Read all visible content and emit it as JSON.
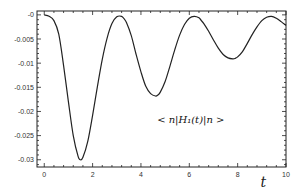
{
  "chart_data": {
    "type": "line",
    "title": "",
    "xlabel": "t",
    "ylabel": "",
    "annotation": "< n|H₁(t)|n >",
    "annotation_position": {
      "t": 5.0,
      "y": -0.0215
    },
    "xlim": [
      -0.3,
      10
    ],
    "ylim": [
      -0.0315,
      0.0008
    ],
    "x_ticks": [
      0,
      2,
      4,
      6,
      8,
      10
    ],
    "x_tick_labels": [
      "0",
      "2",
      "4",
      "6",
      "8",
      "10"
    ],
    "y_ticks": [
      0,
      -0.005,
      -0.01,
      -0.015,
      -0.02,
      -0.025,
      -0.03
    ],
    "y_tick_labels": [
      "-0",
      "-0.005",
      "-0.01",
      "-0.015",
      "-0.02",
      "-0.025",
      "-0.03"
    ],
    "grid": false,
    "legend": null,
    "series": [
      {
        "name": "<n|H1(t)|n>",
        "x": [
          0,
          0.2,
          0.4,
          0.6,
          0.8,
          1.0,
          1.2,
          1.4,
          1.5,
          1.6,
          1.8,
          2.0,
          2.2,
          2.4,
          2.6,
          2.8,
          3.0,
          3.2,
          3.3,
          3.4,
          3.6,
          3.8,
          4.0,
          4.2,
          4.4,
          4.6,
          4.7,
          4.8,
          5.0,
          5.2,
          5.4,
          5.6,
          5.8,
          6.0,
          6.2,
          6.4,
          6.5,
          6.6,
          6.8,
          7.0,
          7.2,
          7.4,
          7.6,
          7.8,
          7.9,
          8.0,
          8.2,
          8.4,
          8.6,
          8.8,
          9.0,
          9.2,
          9.4,
          9.6,
          9.8,
          10.0
        ],
        "y": [
          0,
          -0.0003,
          -0.0012,
          -0.004,
          -0.0105,
          -0.018,
          -0.025,
          -0.0293,
          -0.03,
          -0.0295,
          -0.0262,
          -0.0208,
          -0.0148,
          -0.0092,
          -0.0048,
          -0.0018,
          -0.0004,
          -0.0003,
          -0.0008,
          -0.0016,
          -0.0043,
          -0.0082,
          -0.0118,
          -0.0148,
          -0.0163,
          -0.0168,
          -0.0166,
          -0.016,
          -0.0138,
          -0.0106,
          -0.0072,
          -0.0042,
          -0.002,
          -0.0007,
          -0.0003,
          -0.0006,
          -0.0012,
          -0.0018,
          -0.0034,
          -0.0052,
          -0.0069,
          -0.0082,
          -0.0089,
          -0.0091,
          -0.009,
          -0.0087,
          -0.0076,
          -0.0059,
          -0.0041,
          -0.0025,
          -0.0012,
          -0.0005,
          -0.0003,
          -0.0007,
          -0.0014,
          -0.0022
        ]
      }
    ]
  },
  "frame": {
    "left": 37,
    "right": 286,
    "top": 11,
    "bottom": 167,
    "line_color": "#222222",
    "curve_color": "#222222"
  }
}
